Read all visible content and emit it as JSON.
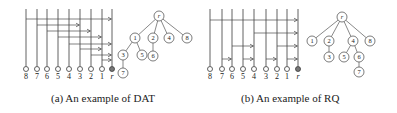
{
  "figures": [
    {
      "id": "a",
      "caption": "(a) An example of DAT",
      "columns": [
        {
          "label": "8",
          "x": 26
        },
        {
          "label": "7",
          "x": 37
        },
        {
          "label": "6",
          "x": 47
        },
        {
          "label": "5",
          "x": 58
        },
        {
          "label": "4",
          "x": 69
        },
        {
          "label": "3",
          "x": 80
        },
        {
          "label": "2",
          "x": 91
        },
        {
          "label": "1",
          "x": 102
        },
        {
          "label": "r",
          "x": 112,
          "root": true
        }
      ],
      "arrows": [
        {
          "from": "8",
          "to": "r",
          "y": 19
        },
        {
          "from": "7",
          "to": "3",
          "y": 25
        },
        {
          "from": "6",
          "to": "2",
          "y": 31
        },
        {
          "from": "5",
          "to": "1",
          "y": 37
        },
        {
          "from": "4",
          "to": "r",
          "y": 44
        },
        {
          "from": "3",
          "to": "1",
          "y": 49
        },
        {
          "from": "2",
          "to": "r",
          "y": 55
        },
        {
          "from": "1",
          "to": "r",
          "y": 60
        }
      ],
      "tree": {
        "nodes": [
          {
            "label": "r",
            "x": 159,
            "y": 16
          },
          {
            "label": "1",
            "x": 135,
            "y": 38
          },
          {
            "label": "2",
            "x": 153,
            "y": 38
          },
          {
            "label": "4",
            "x": 169,
            "y": 38
          },
          {
            "label": "8",
            "x": 187,
            "y": 38
          },
          {
            "label": "3",
            "x": 123,
            "y": 55
          },
          {
            "label": "5",
            "x": 142,
            "y": 55
          },
          {
            "label": "6",
            "x": 153,
            "y": 56
          },
          {
            "label": "7",
            "x": 123,
            "y": 73
          }
        ],
        "edges": [
          [
            "r",
            "1"
          ],
          [
            "r",
            "2"
          ],
          [
            "r",
            "4"
          ],
          [
            "r",
            "8"
          ],
          [
            "1",
            "3"
          ],
          [
            "1",
            "5"
          ],
          [
            "2",
            "6"
          ],
          [
            "3",
            "7"
          ]
        ]
      }
    },
    {
      "id": "b",
      "caption": "(b) An example of RQ",
      "columns": [
        {
          "label": "8",
          "x": 210
        },
        {
          "label": "7",
          "x": 222
        },
        {
          "label": "6",
          "x": 232
        },
        {
          "label": "5",
          "x": 243
        },
        {
          "label": "4",
          "x": 254
        },
        {
          "label": "3",
          "x": 266
        },
        {
          "label": "2",
          "x": 277
        },
        {
          "label": "1",
          "x": 287
        },
        {
          "label": "r",
          "x": 298,
          "root": true
        }
      ],
      "arrows": [
        {
          "from": "8",
          "to": "r",
          "y": 20
        },
        {
          "from": "4",
          "to": "r",
          "y": 33
        },
        {
          "from": "6",
          "to": "4",
          "y": 46
        },
        {
          "from": "2",
          "to": "r",
          "y": 46
        },
        {
          "from": "7",
          "to": "6",
          "y": 59
        },
        {
          "from": "5",
          "to": "4",
          "y": 59
        },
        {
          "from": "3",
          "to": "2",
          "y": 59
        },
        {
          "from": "1",
          "to": "r",
          "y": 59
        }
      ],
      "tree": {
        "nodes": [
          {
            "label": "r",
            "x": 342,
            "y": 17
          },
          {
            "label": "1",
            "x": 312,
            "y": 41
          },
          {
            "label": "2",
            "x": 329,
            "y": 41
          },
          {
            "label": "4",
            "x": 353,
            "y": 41
          },
          {
            "label": "8",
            "x": 370,
            "y": 41
          },
          {
            "label": "3",
            "x": 329,
            "y": 57
          },
          {
            "label": "5",
            "x": 344,
            "y": 57
          },
          {
            "label": "6",
            "x": 359,
            "y": 57
          },
          {
            "label": "7",
            "x": 359,
            "y": 72
          }
        ],
        "edges": [
          [
            "r",
            "1"
          ],
          [
            "r",
            "2"
          ],
          [
            "r",
            "4"
          ],
          [
            "r",
            "8"
          ],
          [
            "2",
            "3"
          ],
          [
            "4",
            "5"
          ],
          [
            "4",
            "6"
          ],
          [
            "6",
            "7"
          ]
        ]
      }
    }
  ]
}
